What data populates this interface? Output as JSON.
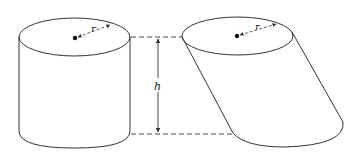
{
  "figure": {
    "left_cylinder": {
      "type": "right-cylinder",
      "radius_label": "r"
    },
    "right_cylinder": {
      "type": "oblique-cylinder",
      "radius_label": "r"
    },
    "height_label": "h",
    "colors": {
      "stroke": "#333333",
      "background": "#ffffff"
    }
  }
}
